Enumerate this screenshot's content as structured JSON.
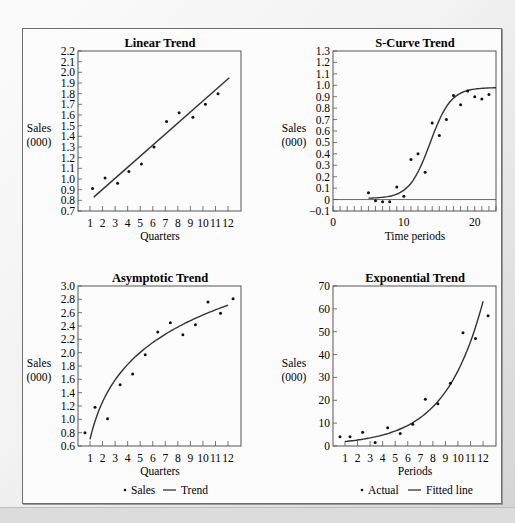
{
  "figure": {
    "background": "#f4f4f4",
    "frame_color": "#6e6e6e",
    "line_color": "#333333",
    "point_color": "#111111"
  },
  "chart_data": [
    {
      "id": "linear",
      "type": "scatter",
      "title": "Linear Trend",
      "xlabel": "Quarters",
      "ylabel": [
        "Sales",
        "(000)"
      ],
      "xticks": [
        "1",
        "2",
        "3",
        "4",
        "5",
        "6",
        "7",
        "8",
        "9",
        "10",
        "11",
        "12"
      ],
      "yticks": [
        "2.2",
        "2.1",
        "2.0",
        "1.9",
        "1.8",
        "1.7",
        "1.6",
        "1.5",
        "1.4",
        "1.3",
        "1.2",
        "1.1",
        "1.0",
        "0.9",
        "0.8",
        "0.7"
      ],
      "ylim": [
        0.7,
        2.2
      ],
      "xlim": [
        0,
        13
      ],
      "grid": false,
      "legend": null,
      "points": [
        [
          1.2,
          0.91
        ],
        [
          2.2,
          1.01
        ],
        [
          3.2,
          0.96
        ],
        [
          4.1,
          1.07
        ],
        [
          5.1,
          1.14
        ],
        [
          6.1,
          1.3
        ],
        [
          7.1,
          1.54
        ],
        [
          8.1,
          1.62
        ],
        [
          9.2,
          1.58
        ],
        [
          10.2,
          1.7
        ],
        [
          11.2,
          1.8
        ]
      ],
      "trend": {
        "kind": "linear",
        "from": [
          1.3,
          0.83
        ],
        "to": [
          12.1,
          1.95
        ]
      }
    },
    {
      "id": "scurve",
      "type": "scatter",
      "title": "S-Curve Trend",
      "xlabel": "Time periods",
      "ylabel": [
        "Sales",
        "(000)"
      ],
      "xticks": [
        "0",
        "10",
        "20"
      ],
      "yticks": [
        "1.3",
        "1.2",
        "1.1",
        "1.0",
        "0.9",
        "0.8",
        "0.7",
        "0.6",
        "0.5",
        "0.4",
        "0.3",
        "0.2",
        "0.1",
        "0",
        "−0.1"
      ],
      "ylim": [
        -0.1,
        1.3
      ],
      "xlim": [
        0,
        23
      ],
      "grid": false,
      "legend": null,
      "points": [
        [
          5,
          0.06
        ],
        [
          6,
          -0.01
        ],
        [
          7,
          -0.02
        ],
        [
          8,
          -0.02
        ],
        [
          9,
          0.11
        ],
        [
          10,
          0.03
        ],
        [
          11,
          0.35
        ],
        [
          12,
          0.4
        ],
        [
          13,
          0.24
        ],
        [
          14,
          0.67
        ],
        [
          15,
          0.56
        ],
        [
          16,
          0.7
        ],
        [
          17,
          0.91
        ],
        [
          18,
          0.83
        ],
        [
          19,
          0.95
        ],
        [
          20,
          0.9
        ],
        [
          21,
          0.88
        ],
        [
          22,
          0.92
        ]
      ],
      "trend": {
        "kind": "logistic",
        "from_x": 5,
        "to_x": 23,
        "L": 0.97,
        "k": 0.68,
        "x0": 13.7,
        "base": 0.01
      }
    },
    {
      "id": "asymptotic",
      "type": "scatter",
      "title": "Asymptotic Trend",
      "xlabel": "Quarters",
      "ylabel": [
        "Sales",
        "(000)"
      ],
      "xticks": [
        "1",
        "2",
        "3",
        "4",
        "5",
        "6",
        "7",
        "8",
        "9",
        "10",
        "11",
        "12"
      ],
      "yticks": [
        "3.0",
        "2.8",
        "2.6",
        "2.4",
        "2.2",
        "2.0",
        "1.8",
        "1.6",
        "1.4",
        "1.2",
        "1.0",
        "0.8",
        "0.6"
      ],
      "ylim": [
        0.6,
        3.0
      ],
      "xlim": [
        0,
        13
      ],
      "grid": false,
      "legend": {
        "marker_label": "Sales",
        "line_label": "Trend"
      },
      "points": [
        [
          0.6,
          0.8
        ],
        [
          1.4,
          1.18
        ],
        [
          2.4,
          1.01
        ],
        [
          3.4,
          1.52
        ],
        [
          4.4,
          1.68
        ],
        [
          5.4,
          1.97
        ],
        [
          6.4,
          2.31
        ],
        [
          7.4,
          2.45
        ],
        [
          8.4,
          2.27
        ],
        [
          9.4,
          2.42
        ],
        [
          10.4,
          2.76
        ],
        [
          11.4,
          2.59
        ],
        [
          12.4,
          2.81
        ]
      ],
      "trend": {
        "kind": "log",
        "from_x": 1,
        "to_x": 12,
        "a": 0.7,
        "b": 0.81
      }
    },
    {
      "id": "exponential",
      "type": "scatter",
      "title": "Exponential Trend",
      "xlabel": "Periods",
      "ylabel": [
        "Sales",
        "(000)"
      ],
      "xticks": [
        "1",
        "2",
        "3",
        "4",
        "5",
        "6",
        "7",
        "8",
        "9",
        "10",
        "11",
        "12"
      ],
      "yticks": [
        "70",
        "60",
        "50",
        "40",
        "30",
        "20",
        "10",
        "0"
      ],
      "ylim": [
        0,
        70
      ],
      "xlim": [
        0,
        13
      ],
      "grid": false,
      "legend": {
        "marker_label": "Actual",
        "line_label": "Fitted line"
      },
      "points": [
        [
          0.6,
          4
        ],
        [
          1.4,
          4
        ],
        [
          2.4,
          6
        ],
        [
          3.4,
          1.5
        ],
        [
          4.4,
          8
        ],
        [
          5.4,
          5.5
        ],
        [
          6.4,
          9.5
        ],
        [
          7.4,
          20.5
        ],
        [
          8.4,
          18.5
        ],
        [
          9.4,
          27.5
        ],
        [
          10.4,
          49.5
        ],
        [
          11.4,
          47
        ],
        [
          12.4,
          57
        ]
      ],
      "trend": {
        "kind": "exp",
        "from_x": 1,
        "to_x": 12,
        "a": 1.2,
        "b": 0.33,
        "c": 0.3
      }
    }
  ]
}
